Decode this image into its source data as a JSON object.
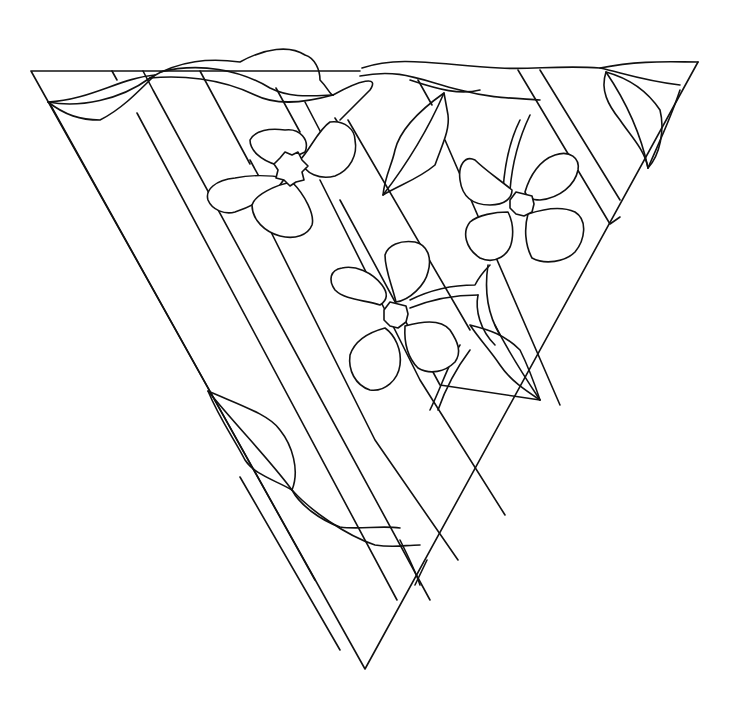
{
  "artwork": {
    "subject": "stained-glass pattern: inverted triangle with diagonal stripes, three flowers and vine leaves",
    "colors": {
      "background": "#ffffff",
      "line": "#111111"
    },
    "flowers": [
      {
        "name": "flower-top-left",
        "cx": 290,
        "cy": 168
      },
      {
        "name": "flower-right",
        "cx": 520,
        "cy": 203
      },
      {
        "name": "flower-center",
        "cx": 393,
        "cy": 315
      }
    ]
  }
}
